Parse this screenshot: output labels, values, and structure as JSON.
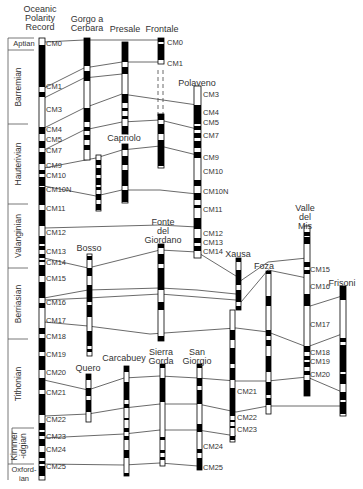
{
  "title_columns": [
    {
      "id": "oceanic",
      "label": "Oceanic\nPolarity\nRecord",
      "x": 40,
      "y": 5
    },
    {
      "id": "gorgo",
      "label": "Gorgo a\nCerbara",
      "x": 87,
      "y": 15
    },
    {
      "id": "presale",
      "label": "Presale",
      "x": 125,
      "y": 25
    },
    {
      "id": "frontale",
      "label": "Frontale",
      "x": 162,
      "y": 25
    },
    {
      "id": "polaveno",
      "label": "Polaveno",
      "x": 197,
      "y": 79
    },
    {
      "id": "capriolo",
      "label": "Capriolo",
      "x": 124,
      "y": 134
    },
    {
      "id": "fonte",
      "label": "Fonte\ndel\nGiordano",
      "x": 163,
      "y": 218
    },
    {
      "id": "bosso",
      "label": "Bosso",
      "x": 89,
      "y": 244
    },
    {
      "id": "xausa",
      "label": "Xausa",
      "x": 238,
      "y": 250
    },
    {
      "id": "foza",
      "label": "Foza",
      "x": 264,
      "y": 262
    },
    {
      "id": "valle",
      "label": "Valle\ndel\nMis",
      "x": 305,
      "y": 204
    },
    {
      "id": "frisoni",
      "label": "Frisoni",
      "x": 342,
      "y": 279
    },
    {
      "id": "quero",
      "label": "Quero",
      "x": 88,
      "y": 364
    },
    {
      "id": "carcabuey",
      "label": "Carcabuey",
      "x": 124,
      "y": 354
    },
    {
      "id": "sierra",
      "label": "Sierra\nGorda",
      "x": 161,
      "y": 348
    },
    {
      "id": "sangiorgio",
      "label": "San\nGiorgio",
      "x": 197,
      "y": 348
    }
  ],
  "stages": [
    {
      "name": "Aptian",
      "y0": 38,
      "y1": 50,
      "rot": false
    },
    {
      "name": "Barremian",
      "y0": 50,
      "y1": 124,
      "rot": true
    },
    {
      "name": "Hauterivian",
      "y0": 124,
      "y1": 204,
      "rot": true
    },
    {
      "name": "Valanginian",
      "y0": 204,
      "y1": 268,
      "rot": true
    },
    {
      "name": "Berriasian",
      "y0": 268,
      "y1": 339,
      "rot": true
    },
    {
      "name": "Tithonian",
      "y0": 339,
      "y1": 428,
      "rot": true
    },
    {
      "name": "Kimmer\n-idgian",
      "y0": 428,
      "y1": 464,
      "rot": true
    },
    {
      "name": "Oxford-\nian",
      "y0": 464,
      "y1": 480,
      "rot": false
    }
  ],
  "chrons": [
    {
      "label": "CM0",
      "y": 44
    },
    {
      "label": "CM1",
      "y": 87
    },
    {
      "label": "CM3",
      "y": 110
    },
    {
      "label": "CM4",
      "y": 130
    },
    {
      "label": "CM5",
      "y": 140
    },
    {
      "label": "CM7",
      "y": 151
    },
    {
      "label": "CM9",
      "y": 166
    },
    {
      "label": "CM10",
      "y": 176
    },
    {
      "label": "CM10N",
      "y": 190
    },
    {
      "label": "CM11",
      "y": 209
    },
    {
      "label": "CM12",
      "y": 233
    },
    {
      "label": "CM13",
      "y": 252
    },
    {
      "label": "CM14",
      "y": 263
    },
    {
      "label": "CM15",
      "y": 279
    },
    {
      "label": "CM16",
      "y": 303
    },
    {
      "label": "CM17",
      "y": 321
    },
    {
      "label": "CM18",
      "y": 337
    },
    {
      "label": "CM19",
      "y": 355
    },
    {
      "label": "CM20",
      "y": 373
    },
    {
      "label": "CM21",
      "y": 393
    },
    {
      "label": "CM22",
      "y": 420
    },
    {
      "label": "CM23",
      "y": 437
    },
    {
      "label": "CM24",
      "y": 450
    },
    {
      "label": "CM25",
      "y": 467
    }
  ],
  "side_chron_labels": [
    {
      "label": "CM0",
      "x": 167,
      "y": 43
    },
    {
      "label": "CM1",
      "x": 167,
      "y": 64
    },
    {
      "label": "CM3",
      "x": 203,
      "y": 95
    },
    {
      "label": "CM4",
      "x": 203,
      "y": 113
    },
    {
      "label": "CM5",
      "x": 203,
      "y": 123
    },
    {
      "label": "CM7",
      "x": 203,
      "y": 136
    },
    {
      "label": "CM9",
      "x": 203,
      "y": 158
    },
    {
      "label": "CM10",
      "x": 203,
      "y": 172
    },
    {
      "label": "CM10N",
      "x": 203,
      "y": 192
    },
    {
      "label": "CM11",
      "x": 203,
      "y": 210
    },
    {
      "label": "CM12",
      "x": 203,
      "y": 234
    },
    {
      "label": "CM13",
      "x": 203,
      "y": 243
    },
    {
      "label": "CM14",
      "x": 203,
      "y": 252
    },
    {
      "label": "CM15",
      "x": 310,
      "y": 270
    },
    {
      "label": "CM16",
      "x": 310,
      "y": 287
    },
    {
      "label": "CM17",
      "x": 310,
      "y": 325
    },
    {
      "label": "CM18",
      "x": 310,
      "y": 353
    },
    {
      "label": "CM19",
      "x": 310,
      "y": 362
    },
    {
      "label": "CM20",
      "x": 310,
      "y": 375
    },
    {
      "label": "CM21",
      "x": 237,
      "y": 392
    },
    {
      "label": "CM22",
      "x": 237,
      "y": 418
    },
    {
      "label": "CM23",
      "x": 237,
      "y": 430
    },
    {
      "label": "CM24",
      "x": 203,
      "y": 447
    },
    {
      "label": "CM25",
      "x": 203,
      "y": 468
    }
  ],
  "legend_note": "Black = normal polarity, White = reversed polarity",
  "colors": {
    "normal": "#000000",
    "reversed": "#ffffff",
    "line": "#333333"
  }
}
